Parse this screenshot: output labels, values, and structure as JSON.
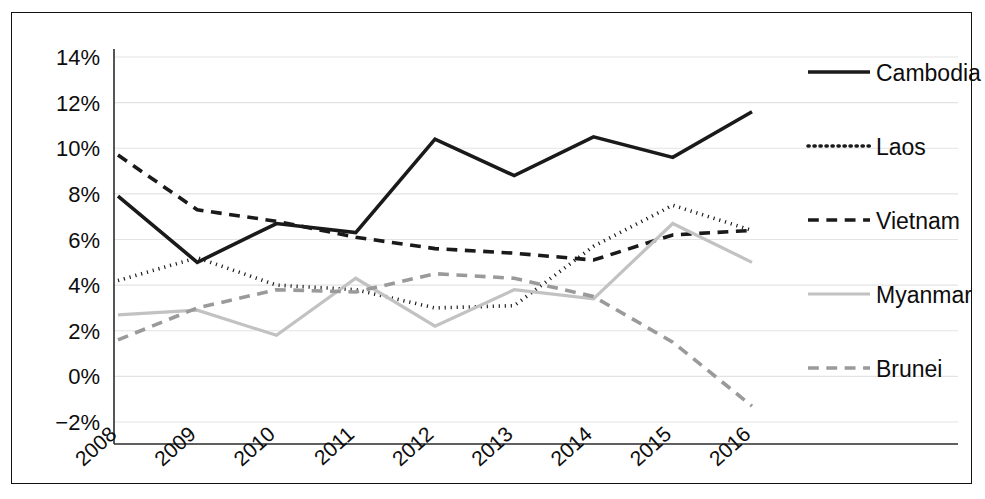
{
  "chart_data": {
    "type": "line",
    "title": "",
    "subtitle": "",
    "xlabel": "",
    "ylabel": "",
    "categories": [
      "2008",
      "2009",
      "2010",
      "2011",
      "2012",
      "2013",
      "2014",
      "2015",
      "2016"
    ],
    "x_tick_labels": [
      "2008",
      "2009",
      "2010",
      "2011",
      "2012",
      "2013",
      "2014",
      "2015",
      "2016"
    ],
    "y_tick_labels": [
      "14%",
      "12%",
      "10%",
      "8%",
      "6%",
      "4%",
      "2%",
      "0%",
      "−2%"
    ],
    "y_tick_values": [
      14,
      12,
      10,
      8,
      6,
      4,
      2,
      0,
      -2
    ],
    "ylim": [
      -2,
      14
    ],
    "y_unit": "%",
    "grid": true,
    "legend_position": "right",
    "series": [
      {
        "name": "Cambodia",
        "style": "solid",
        "color": "#1a1a1a",
        "width": 3.6,
        "values": [
          7.9,
          5.0,
          6.7,
          6.3,
          10.4,
          8.8,
          10.5,
          9.6,
          11.6
        ]
      },
      {
        "name": "Laos",
        "style": "dotted",
        "color": "#1a1a1a",
        "width": 3.6,
        "values": [
          4.2,
          5.2,
          4.0,
          3.8,
          3.0,
          3.1,
          5.7,
          7.5,
          6.4
        ]
      },
      {
        "name": "Vietnam",
        "style": "dashed",
        "color": "#1a1a1a",
        "width": 3.6,
        "values": [
          9.7,
          7.3,
          6.8,
          6.1,
          5.6,
          5.4,
          5.1,
          6.2,
          6.4
        ]
      },
      {
        "name": "Myanmar",
        "style": "solid",
        "color": "#c2c2c2",
        "width": 3.2,
        "values": [
          2.7,
          2.9,
          1.8,
          4.3,
          2.2,
          3.8,
          3.4,
          6.7,
          5.0
        ]
      },
      {
        "name": "Brunei",
        "style": "dashed",
        "color": "#9a9a9a",
        "width": 3.6,
        "values": [
          1.6,
          3.0,
          3.8,
          3.7,
          4.5,
          4.3,
          3.5,
          1.5,
          -1.3
        ]
      }
    ]
  },
  "legend": {
    "items": [
      {
        "label": "Cambodia"
      },
      {
        "label": "Laos"
      },
      {
        "label": "Vietnam"
      },
      {
        "label": "Myanmar"
      },
      {
        "label": "Brunei"
      }
    ]
  }
}
